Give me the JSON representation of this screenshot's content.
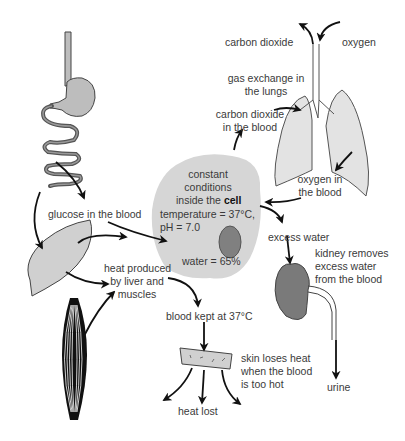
{
  "diagram": {
    "colors": {
      "organ_fill": "#cfcfcf",
      "cell_fill": "#d6d6d6",
      "nucleus_fill": "#808080",
      "kidney_fill": "#7a7a7a",
      "arrow": "#111111",
      "text": "#3a3a3a"
    },
    "cell": {
      "line1": "constant",
      "line2": "conditions",
      "line3_prefix": "inside the ",
      "line3_bold": "cell",
      "temperature": "temperature = 37°C,",
      "ph": "pH = 7.0",
      "water": "water = 65%"
    },
    "lungs": {
      "carbon_dioxide_out": "carbon dioxide",
      "oxygen_in": "oxygen",
      "gas_exchange_line1": "gas exchange in",
      "gas_exchange_line2": "the lungs",
      "co2_blood_line1": "carbon dioxide",
      "co2_blood_line2": "in the blood",
      "o2_blood_line1": "oxygen in",
      "o2_blood_line2": "the blood"
    },
    "digestion": {
      "glucose": "glucose in the blood"
    },
    "heat": {
      "produced_line1": "heat produced",
      "produced_line2": "by liver and",
      "produced_line3": "muscles",
      "blood_kept": "blood kept at 37°C",
      "skin_line1": "skin loses heat",
      "skin_line2": "when the blood",
      "skin_line3": "is too hot",
      "heat_lost": "heat lost"
    },
    "kidney": {
      "excess_water": "excess water",
      "removes_line1": "kidney removes",
      "removes_line2": "excess water",
      "removes_line3": "from the blood",
      "urine": "urine"
    }
  }
}
